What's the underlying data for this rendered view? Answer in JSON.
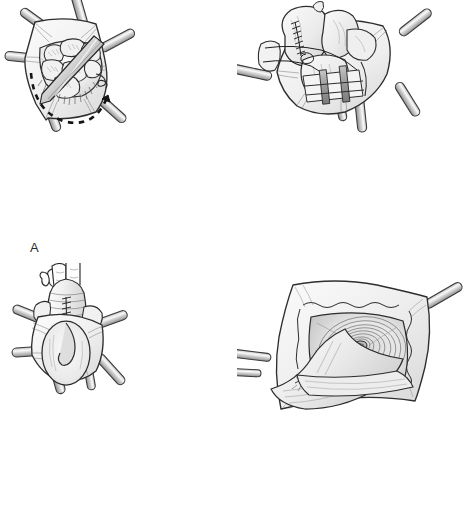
{
  "figure": {
    "background_color": "#ffffff",
    "width": 474,
    "height": 526,
    "style": "grayscale pen-and-ink medical line illustration",
    "layout": "2x2 panel grid"
  },
  "colors": {
    "ink": "#1f1f1f",
    "outline": "#333333",
    "tissue_light": "#f2f2f2",
    "tissue_mid": "#e2e2e2",
    "tissue_dark": "#c9c9c9",
    "shadow": "#b0b0b0",
    "instrument_body": "#d4d4d4",
    "instrument_shade": "#9e9e9e",
    "instrument_highlight": "#fbfbfb",
    "label_text": "#2b2b2b",
    "background": "#ffffff"
  },
  "panels": [
    {
      "id": "a",
      "label": "A",
      "caption": "Laparotomy wound held open by six retractor blades; intestinal loops exposed within the peritoneal cavity, an instrument laid across the field, and a dashed curved arrow indicating the direction of mobilization.",
      "elements": {
        "retractor_count": 6,
        "instrument_name": "handheld-retractor",
        "arrow_name": "dashed-arc-arrow",
        "arrow_style": "dashed",
        "arrow_direction": "counterclockwise sweep to the right",
        "tissue_name": "intestinal-loops"
      }
    },
    {
      "id": "b",
      "label": "B",
      "caption": "Bowel segment delivered through the wound with a running suture line along the antimesenteric border; retractor blades maintain exposure of the deeper field.",
      "elements": {
        "retractor_count": 5,
        "suture_name": "running-suture-line",
        "tissue_name": "bowel-segment",
        "deep_structure_name": "deep-field-bands"
      }
    },
    {
      "id": "c",
      "label": "C",
      "caption": "Surgeon's hand elevates the closed, sutured bowel limb vertically out of the wound while six retractors hold the fascial edges apart; the stoma aperture is visible below.",
      "elements": {
        "retractor_count": 6,
        "hand_name": "surgeon-hand",
        "suture_name": "longitudinal-suture-line",
        "aperture_name": "fascial-aperture",
        "tissue_name": "exteriorized-bowel-limb"
      }
    },
    {
      "id": "d",
      "label": "D",
      "caption": "Close-up of the completed aperture: layered fascial and peritoneal flaps are retracted by two blades, revealing concentric tissue rings converging on the central orifice.",
      "elements": {
        "retractor_count": 2,
        "orifice_name": "central-orifice",
        "rings_name": "concentric-tissue-rings",
        "flap_name": "retracted-tissue-flap"
      }
    }
  ]
}
